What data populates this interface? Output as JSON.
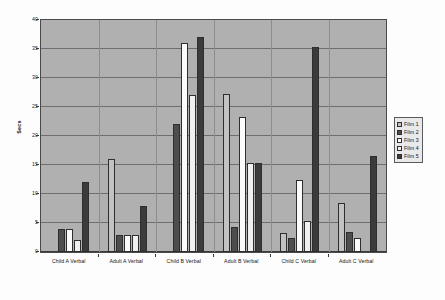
{
  "chart_data": {
    "type": "bar",
    "title": "",
    "xlabel": "",
    "ylabel": "Secs",
    "ylim": [
      0,
      40
    ],
    "ytick_step": 5,
    "yticks": [
      "0",
      "5",
      "10",
      "15",
      "20",
      "25",
      "30",
      "35",
      "40"
    ],
    "grid": true,
    "legend_position": "right",
    "categories": [
      "Child A Verbal",
      "Adult A Verbal",
      "Child B Verbal",
      "Adult B Verbal",
      "Child C Verbal",
      "Adult C Verbal"
    ],
    "series": [
      {
        "name": "Film 1",
        "color": "#c2c2c2",
        "values": [
          0,
          16,
          0,
          27.3,
          3.3,
          8.5
        ]
      },
      {
        "name": "Film 2",
        "color": "#4d4d4d",
        "values": [
          4,
          3,
          22,
          4.3,
          2.4,
          3.5
        ]
      },
      {
        "name": "Film 3",
        "color": "#fbfbfb",
        "values": [
          4,
          3,
          36,
          23.3,
          12.4,
          2.5
        ]
      },
      {
        "name": "Film 4",
        "color": "#f0f0f0",
        "values": [
          2,
          3,
          27,
          15.3,
          5.3,
          0
        ]
      },
      {
        "name": "Film 5",
        "color": "#3b3b3b",
        "values": [
          12,
          8,
          37,
          15.3,
          35.3,
          16.5
        ]
      }
    ]
  },
  "legend": {
    "entries": [
      {
        "label": "Film 1"
      },
      {
        "label": "Film 2"
      },
      {
        "label": "Film 3"
      },
      {
        "label": "Film 4"
      },
      {
        "label": "Film 5"
      }
    ]
  },
  "colors": {
    "plot_background": "#b0b0b0",
    "figure_background": "#fdfdfd",
    "gridline": "#6e6e6e",
    "axis": "#3a3a3a",
    "legend_background": "#e9e9e9"
  }
}
